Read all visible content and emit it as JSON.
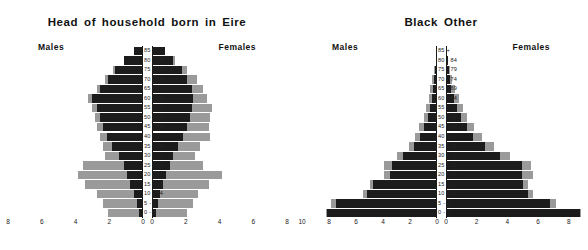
{
  "panels": [
    {
      "title": "Head of household born in Eire",
      "males_label": "Males",
      "females_label": "Females"
    },
    {
      "title": "Black Other",
      "males_label": "Males",
      "females_label": "Females"
    }
  ],
  "age_bands": [
    "85 +",
    "80 - 84",
    "75 - 79",
    "70 - 74",
    "65 - 69",
    "60 - 64",
    "55 - 59",
    "50 - 54",
    "45 - 49",
    "40 - 44",
    "35 - 39",
    "30 - 34",
    "25 - 29",
    "20 - 24",
    "15 - 19",
    "10 - 14",
    "5 - 9",
    "0 - 4"
  ],
  "colors": {
    "dark_segment": "#1c1c1c",
    "light_segment": "#9a9a9a",
    "axis": "#111111",
    "background": "#ffffff"
  },
  "chart_data": [
    {
      "type": "bar",
      "subtype": "population-pyramid",
      "title": "Head of household born in Eire",
      "xlabel": "",
      "ylabel": "",
      "categories": [
        "85 +",
        "80 - 84",
        "75 - 79",
        "70 - 74",
        "65 - 69",
        "60 - 64",
        "55 - 59",
        "50 - 54",
        "45 - 49",
        "40 - 44",
        "35 - 39",
        "30 - 34",
        "25 - 29",
        "20 - 24",
        "15 - 19",
        "10 - 14",
        "5 - 9",
        "0 - 4"
      ],
      "grid": false,
      "legend": "none",
      "axes": {
        "males": {
          "ticks": [
            8,
            6,
            4,
            2,
            0
          ],
          "xlim": [
            8,
            0
          ],
          "direction": "right-to-left"
        },
        "females": {
          "ticks": [
            0,
            2,
            4,
            6,
            8
          ],
          "xlim": [
            0,
            8
          ],
          "direction": "left-to-right"
        }
      },
      "series": [
        {
          "name": "Males dark",
          "side": "males",
          "values": [
            0.55,
            1.15,
            1.65,
            2.05,
            2.55,
            3.05,
            2.75,
            2.55,
            2.35,
            2.15,
            1.85,
            1.45,
            1.15,
            0.95,
            0.75,
            0.55,
            0.35,
            0.25
          ]
        },
        {
          "name": "Males light",
          "side": "males",
          "values": [
            0.55,
            1.15,
            1.75,
            2.25,
            2.75,
            3.25,
            3.05,
            2.85,
            2.75,
            2.55,
            2.35,
            2.25,
            3.55,
            3.85,
            3.45,
            2.75,
            2.35,
            2.05
          ]
        },
        {
          "name": "Females dark",
          "side": "females",
          "values": [
            0.75,
            1.25,
            1.75,
            2.05,
            2.35,
            2.45,
            2.35,
            2.25,
            2.05,
            1.85,
            1.55,
            1.25,
            1.05,
            0.85,
            0.65,
            0.45,
            0.35,
            0.25
          ]
        },
        {
          "name": "Females light",
          "side": "females",
          "values": [
            0.75,
            1.35,
            2.05,
            2.65,
            3.05,
            3.25,
            3.55,
            3.45,
            3.35,
            3.45,
            2.85,
            2.55,
            3.05,
            4.15,
            3.35,
            2.75,
            2.45,
            2.05
          ]
        }
      ]
    },
    {
      "type": "bar",
      "subtype": "population-pyramid",
      "title": "Black Other",
      "xlabel": "",
      "ylabel": "",
      "categories": [
        "85 +",
        "80 - 84",
        "75 - 79",
        "70 - 74",
        "65 - 69",
        "60 - 64",
        "55 - 59",
        "50 - 54",
        "45 - 49",
        "40 - 44",
        "35 - 39",
        "30 - 34",
        "25 - 29",
        "20 - 24",
        "15 - 19",
        "10 - 14",
        "5 - 9",
        "0 - 4"
      ],
      "grid": false,
      "legend": "none",
      "axes": {
        "males": {
          "ticks": [
            10,
            8,
            6,
            4,
            2,
            0
          ],
          "xlim": [
            10,
            0
          ],
          "direction": "right-to-left"
        },
        "females": {
          "ticks": [
            0,
            2,
            4,
            6,
            8
          ],
          "xlim": [
            0,
            8.8
          ],
          "direction": "left-to-right"
        }
      },
      "series": [
        {
          "name": "Males dark",
          "side": "males",
          "values": [
            0.05,
            0.1,
            0.15,
            0.25,
            0.3,
            0.4,
            0.55,
            0.7,
            0.95,
            1.25,
            1.7,
            2.55,
            3.35,
            3.45,
            4.75,
            5.15,
            7.45,
            8.15
          ]
        },
        {
          "name": "Males light",
          "side": "males",
          "values": [
            0.05,
            0.1,
            0.2,
            0.35,
            0.55,
            0.6,
            0.85,
            1.0,
            1.35,
            1.6,
            2.05,
            2.95,
            3.95,
            3.95,
            5.0,
            5.45,
            7.85,
            8.25
          ]
        },
        {
          "name": "Females dark",
          "side": "females",
          "values": [
            0.08,
            0.12,
            0.18,
            0.28,
            0.35,
            0.5,
            0.7,
            0.95,
            1.35,
            1.75,
            2.55,
            3.55,
            4.95,
            4.95,
            5.05,
            5.35,
            6.75,
            8.75
          ]
        },
        {
          "name": "Females light",
          "side": "females",
          "values": [
            0.08,
            0.14,
            0.25,
            0.4,
            0.6,
            0.85,
            1.1,
            1.4,
            1.85,
            2.35,
            3.15,
            4.15,
            5.55,
            5.65,
            5.35,
            5.65,
            7.15,
            8.8
          ]
        }
      ]
    }
  ]
}
